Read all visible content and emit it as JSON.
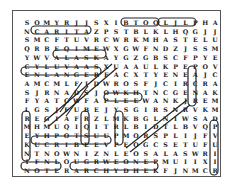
{
  "puzzle": {
    "type": "word-search",
    "cols": 20,
    "rows": 18,
    "grid": [
      "SOMYRJJSXIBTOOLJLPHAXN",
      "NCARITAZPSTBLKLHQGJJYD",
      "SMCFTUVRCWRKMHASTELUMAY",
      "QRBEQIMEWXGWFNDZJSSMBRL",
      "YWVALASKAYGZGBSCFPYEURO",
      "CYLUVAASXUAAULKPEPOVUZUH",
      "ENLANGERFACXTYENEAJCL",
      "AMCMLFIDWROSFJCIRCRAMS",
      "SJRNADSJOWKHTNCGENAKS",
      "FYATCWFAPLEEWANKJREMTK",
      "LGSJFUBEJYSGIRSNRVKMNA",
      "REGIAFRZLMKBGLNIWSADV",
      "MHMUQIQITRLBIDTLBVQPI",
      "EYHPOTSUUPMORSPLIJFV",
      "KUCRIBEEVPEOGCSETUFUH",
      "NTNOWNIZNLEOSALASWRIS",
      "IFNLOUGRWEONEPMUIIXION",
      "NOTERARCHYDHEKFJNMCROI"
    ],
    "found_words": [
      {
        "word": "CARITA",
        "direction": "horizontal",
        "row": 2
      },
      {
        "word": "OOLJ",
        "direction": "horizontal",
        "row": 1
      },
      {
        "word": "LPHA",
        "direction": "horizontal",
        "row": 1
      },
      {
        "word": "ALASKA",
        "direction": "horizontal",
        "row": 5
      },
      {
        "word": "ENLANGERE",
        "direction": "horizontal",
        "row": 7
      },
      {
        "word": "HIERARCHY",
        "direction": "horizontal",
        "row": 15
      },
      {
        "word": "CANISLUPUS",
        "direction": "horizontal",
        "row": 18
      },
      {
        "word": "PREY",
        "direction": "horizontal",
        "row": 18
      },
      {
        "word": "GENS",
        "direction": "horizontal",
        "row": 11
      },
      {
        "word": "KENINA",
        "direction": "vertical",
        "col": 1
      },
      {
        "word": "LAMNA",
        "direction": "vertical",
        "col": 18
      },
      {
        "word": "NILWOLF",
        "direction": "vertical",
        "col": 20
      },
      {
        "word": "SCENT",
        "direction": "vertical",
        "col": 11
      },
      {
        "word": "PACK",
        "direction": "vertical",
        "col": 8
      },
      {
        "word": "diagonal-1",
        "direction": "diagonal"
      },
      {
        "word": "diagonal-2",
        "direction": "diagonal"
      },
      {
        "word": "diagonal-3",
        "direction": "diagonal"
      }
    ]
  }
}
